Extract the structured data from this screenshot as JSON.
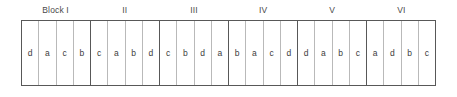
{
  "figure": {
    "kind": "randomized-complete-block-design-layout",
    "treatment_symbols": [
      "a",
      "b",
      "c",
      "d"
    ],
    "block_count": 6,
    "plots_per_block": 4
  },
  "style": {
    "frame_color": "#585858",
    "cell_divider_color": "#b9b9b9",
    "text_color": "#3c3c3c",
    "label_color": "#4a4a4a",
    "background": "#ffffff"
  },
  "blocks": [
    {
      "label": "Block I",
      "cells": [
        "d",
        "a",
        "c",
        "b"
      ]
    },
    {
      "label": "II",
      "cells": [
        "c",
        "a",
        "b",
        "d"
      ]
    },
    {
      "label": "III",
      "cells": [
        "c",
        "b",
        "d",
        "a"
      ]
    },
    {
      "label": "IV",
      "cells": [
        "b",
        "a",
        "c",
        "d"
      ]
    },
    {
      "label": "V",
      "cells": [
        "d",
        "a",
        "b",
        "c"
      ]
    },
    {
      "label": "VI",
      "cells": [
        "a",
        "d",
        "b",
        "c"
      ]
    }
  ]
}
